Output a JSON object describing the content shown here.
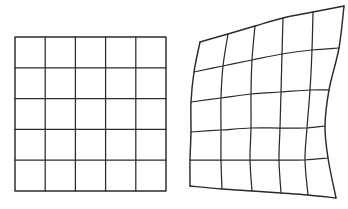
{
  "figure": {
    "background_color": "#ffffff",
    "line_color": "#2b2b2b",
    "canvas": {
      "width": 348,
      "height": 209
    }
  },
  "panels": [
    {
      "id": "source-grid",
      "label": "Undeformed regular grid",
      "kind": "regular",
      "rows": 5,
      "cols": 5,
      "bounds": {
        "x0": 15,
        "y0": 37,
        "x1": 166,
        "y1": 191
      },
      "line_color": "#2b2b2b",
      "line_width": 1.25
    },
    {
      "id": "warped-grid",
      "label": "Deformed warped grid",
      "kind": "warped",
      "rows": 5,
      "cols": 5,
      "line_color": "#2b2b2b",
      "line_width": 1.25,
      "corners": {
        "top_left": [
          200,
          42
        ],
        "top_right": [
          344,
          6
        ],
        "bottom_right": [
          336,
          198
        ],
        "bottom_left": [
          190,
          186
        ]
      },
      "lattice": [
        [
          [
            200,
            42
          ],
          [
            228,
            34
          ],
          [
            255,
            26
          ],
          [
            283,
            18
          ],
          [
            313,
            12
          ],
          [
            344,
            6
          ]
        ],
        [
          [
            194,
            72
          ],
          [
            223,
            66
          ],
          [
            252,
            60
          ],
          [
            282,
            54
          ],
          [
            312,
            50
          ],
          [
            339,
            48
          ]
        ],
        [
          [
            191,
            102
          ],
          [
            221,
            98
          ],
          [
            251,
            94
          ],
          [
            281,
            92
          ],
          [
            310,
            90
          ],
          [
            329,
            90
          ]
        ],
        [
          [
            191,
            132
          ],
          [
            221,
            130
          ],
          [
            251,
            128
          ],
          [
            280,
            128
          ],
          [
            307,
            128
          ],
          [
            325,
            126
          ]
        ],
        [
          [
            190,
            160
          ],
          [
            221,
            160
          ],
          [
            250,
            160
          ],
          [
            279,
            160
          ],
          [
            305,
            160
          ],
          [
            328,
            158
          ]
        ],
        [
          [
            190,
            186
          ],
          [
            222,
            189
          ],
          [
            252,
            191
          ],
          [
            281,
            193
          ],
          [
            308,
            195
          ],
          [
            336,
            198
          ]
        ]
      ]
    }
  ],
  "chart_data": {
    "type": "diagram",
    "series": [
      {
        "name": "source-grid",
        "note": "regular 5 by 5 square lattice",
        "rows": 5,
        "cols": 5
      },
      {
        "name": "warped-grid",
        "note": "5 by 5 lattice after smooth nonlinear warp",
        "rows": 5,
        "cols": 5
      }
    ]
  }
}
